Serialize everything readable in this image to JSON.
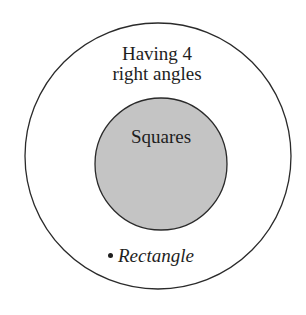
{
  "diagram": {
    "type": "venn / nested set diagram",
    "outer_set": {
      "label_line1": "Having 4",
      "label_line2": "right angles",
      "fill": "#ffffff",
      "stroke": "#2a2a2a"
    },
    "inner_set": {
      "label": "Squares",
      "fill": "#c4c4c4",
      "stroke": "#2a2a2a"
    },
    "elements": [
      {
        "label": "Rectangle",
        "marker": "•",
        "location": "outer set only"
      }
    ]
  }
}
